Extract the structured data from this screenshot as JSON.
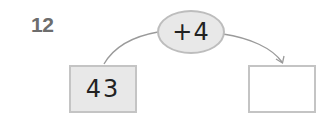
{
  "problem": {
    "number": "12",
    "operation": "+4",
    "input_value": "43",
    "output_value": ""
  },
  "colors": {
    "label": "#6d6d6d",
    "fill": "#e8e8e8",
    "border": "#c4c4c4",
    "line": "#9a9a9a"
  }
}
